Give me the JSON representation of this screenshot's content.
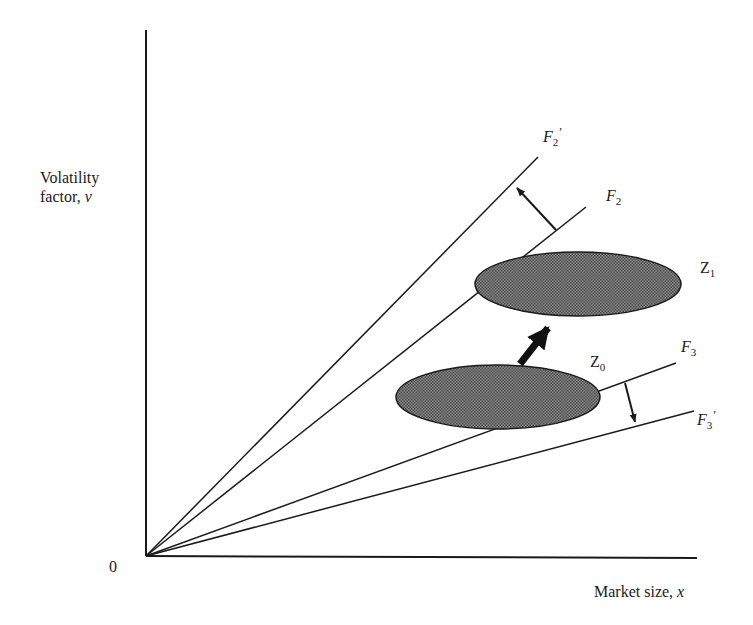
{
  "axes": {
    "y_label_line1": "Volatility",
    "y_label_line2": "factor, ",
    "y_label_var": "v",
    "x_label_text": "Market size, ",
    "x_label_var": "x",
    "origin_label": "0"
  },
  "labels": {
    "F2prime": {
      "letter": "F",
      "sub": "2",
      "prime": "′"
    },
    "F2": {
      "letter": "F",
      "sub": "2"
    },
    "F3": {
      "letter": "F",
      "sub": "3"
    },
    "F3prime": {
      "letter": "F",
      "sub": "3",
      "prime": "′"
    },
    "Z1": {
      "letter": "Z",
      "sub": "1"
    },
    "Z0": {
      "letter": "Z",
      "sub": "0"
    }
  },
  "colors": {
    "line": "#1a1a1a",
    "ellipse_fill": "#6e6e6e",
    "ellipse_stroke": "#1a1a1a"
  },
  "geometry": {
    "origin": [
      146,
      556
    ],
    "y_axis_top": [
      146,
      30
    ],
    "x_axis_end": [
      697,
      558
    ],
    "rays": [
      {
        "name": "F2prime",
        "end": [
          538,
          157
        ]
      },
      {
        "name": "F2",
        "end": [
          586,
          207
        ]
      },
      {
        "name": "F3",
        "end": [
          676,
          363
        ]
      },
      {
        "name": "F3prime",
        "end": [
          694,
          411
        ]
      }
    ],
    "ellipses": [
      {
        "name": "Z1",
        "cx": 578,
        "cy": 284,
        "rx": 103,
        "ry": 32
      },
      {
        "name": "Z0",
        "cx": 498,
        "cy": 397,
        "rx": 102,
        "ry": 32
      }
    ],
    "arrows": [
      {
        "name": "F2-to-F2prime",
        "from": [
          556,
          230
        ],
        "to": [
          515,
          186
        ],
        "thick": false
      },
      {
        "name": "F3-to-F3prime",
        "from": [
          625,
          383
        ],
        "to": [
          636,
          424
        ],
        "thick": false
      },
      {
        "name": "Z0-to-Z1",
        "from": [
          520,
          364
        ],
        "to": [
          556,
          318
        ],
        "thick": true
      }
    ]
  }
}
